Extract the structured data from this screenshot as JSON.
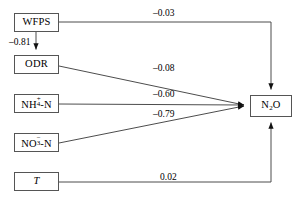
{
  "diagram": {
    "type": "path-analysis-diagram",
    "title": "",
    "background_color": "#ffffff",
    "line_color": "#4d4d4d",
    "box_border_color": "#555555",
    "text_color": "#000000",
    "nodes": [
      {
        "id": "wfps",
        "label": "WFPS",
        "x": 14,
        "y": 13,
        "w": 45,
        "h": 19
      },
      {
        "id": "odr",
        "label": "ODR",
        "x": 14,
        "y": 55,
        "w": 45,
        "h": 19
      },
      {
        "id": "nh4n",
        "label": "NH4+-N",
        "x": 14,
        "y": 94,
        "w": 45,
        "h": 19
      },
      {
        "id": "no3n",
        "label": "NO3--N",
        "x": 14,
        "y": 133,
        "w": 45,
        "h": 19
      },
      {
        "id": "temp",
        "label": "T",
        "x": 14,
        "y": 172,
        "w": 45,
        "h": 19
      },
      {
        "id": "n2o",
        "label": "N2O",
        "x": 250,
        "y": 95,
        "w": 42,
        "h": 22
      }
    ],
    "edges": [
      {
        "id": "wfps-odr",
        "from": "wfps",
        "to": "odr",
        "coefficient": "–0.81",
        "label_x": 9,
        "label_y": 38
      },
      {
        "id": "wfps-n2o",
        "from": "wfps",
        "to": "n2o",
        "coefficient": "–0.03",
        "label_x": 155,
        "label_y": 10
      },
      {
        "id": "odr-n2o",
        "from": "odr",
        "to": "n2o",
        "coefficient": "–0.08",
        "label_x": 155,
        "label_y": 65
      },
      {
        "id": "nh4n-n2o",
        "from": "nh4n",
        "to": "n2o",
        "coefficient": "–0.60",
        "label_x": 155,
        "label_y": 91
      },
      {
        "id": "no3n-n2o",
        "from": "no3n",
        "to": "n2o",
        "coefficient": "–0.79",
        "label_x": 155,
        "label_y": 111
      },
      {
        "id": "temp-n2o",
        "from": "temp",
        "to": "n2o",
        "coefficient": "0.02",
        "label_x": 160,
        "label_y": 174
      }
    ]
  }
}
